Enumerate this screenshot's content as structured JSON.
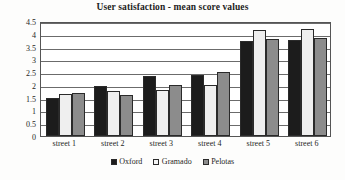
{
  "chart_data": {
    "type": "bar",
    "title": "User satisfaction - mean score values",
    "xlabel": "",
    "ylabel": "",
    "ylim": [
      0,
      4.5
    ],
    "yticks": [
      "0",
      "0.5",
      "1",
      "1.5",
      "2",
      "2.5",
      "3",
      "3.5",
      "4",
      "4.5"
    ],
    "ytick_values": [
      0,
      0.5,
      1,
      1.5,
      2,
      2.5,
      3,
      3.5,
      4,
      4.5
    ],
    "grid": true,
    "legend_position": "bottom",
    "categories": [
      "street 1",
      "street 2",
      "street 3",
      "street 4",
      "street 5",
      "street 6"
    ],
    "series": [
      {
        "name": "Oxford",
        "color": "#1c1c1c",
        "values": [
          1.5,
          1.95,
          2.35,
          2.4,
          3.7,
          3.75
        ]
      },
      {
        "name": "Gramado",
        "color": "#efefef",
        "values": [
          1.65,
          1.75,
          1.8,
          2.0,
          4.15,
          4.2
        ]
      },
      {
        "name": "Pelotas",
        "color": "#8c8c8c",
        "values": [
          1.7,
          1.6,
          2.0,
          2.5,
          3.8,
          3.85
        ]
      }
    ]
  }
}
